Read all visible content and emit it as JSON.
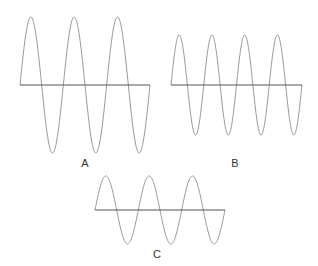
{
  "diagram": {
    "background": "#ffffff",
    "wave_color": "#9a9a9a",
    "axis_color": "#555555",
    "label_color": "#333333",
    "waves": [
      {
        "id": "A",
        "label": "A",
        "x_start": 20,
        "x_end": 150,
        "axis_y": 85,
        "amplitude": 68,
        "cycles": 3,
        "label_x": 85,
        "label_y": 167
      },
      {
        "id": "B",
        "label": "B",
        "x_start": 171,
        "x_end": 302,
        "axis_y": 85,
        "amplitude": 50,
        "cycles": 4,
        "label_x": 235,
        "label_y": 167
      },
      {
        "id": "C",
        "label": "C",
        "x_start": 95,
        "x_end": 225,
        "axis_y": 210,
        "amplitude": 34,
        "cycles": 3,
        "label_x": 157,
        "label_y": 258
      }
    ]
  }
}
